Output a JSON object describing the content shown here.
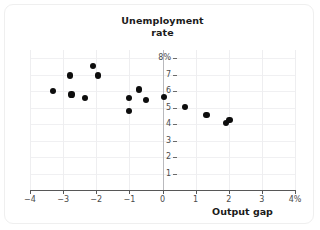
{
  "chart_data": {
    "type": "scatter",
    "title": "Unemployment rate",
    "title_line1": "Unemployment",
    "title_line2": "rate",
    "xlabel": "Output gap",
    "ylabel": "Unemployment rate",
    "xlim": [
      -4,
      4
    ],
    "ylim": [
      0,
      8.5
    ],
    "grid": true,
    "legend": null,
    "xticks": [
      -4,
      -3,
      -2,
      -1,
      0,
      1,
      2,
      3,
      4
    ],
    "xtick_labels": [
      "−4",
      "−3",
      "−2",
      "−1",
      "0",
      "1",
      "2",
      "3",
      "4%"
    ],
    "yticks": [
      1,
      2,
      3,
      4,
      5,
      6,
      7,
      8
    ],
    "ytick_labels": [
      "1",
      "2",
      "3",
      "4",
      "5",
      "6",
      "7",
      "8%"
    ],
    "point_color": "#0d0d0d",
    "points": [
      {
        "x": -3.3,
        "y": 6.0
      },
      {
        "x": -2.8,
        "y": 6.95
      },
      {
        "x": -2.75,
        "y": 5.8
      },
      {
        "x": -2.35,
        "y": 5.6
      },
      {
        "x": -2.1,
        "y": 7.55
      },
      {
        "x": -1.95,
        "y": 6.95
      },
      {
        "x": -1.0,
        "y": 5.6
      },
      {
        "x": -1.0,
        "y": 4.8
      },
      {
        "x": -0.7,
        "y": 6.1
      },
      {
        "x": -0.5,
        "y": 5.45
      },
      {
        "x": 0.05,
        "y": 5.65
      },
      {
        "x": 0.68,
        "y": 5.05
      },
      {
        "x": 1.33,
        "y": 4.55
      },
      {
        "x": 1.92,
        "y": 4.05
      },
      {
        "x": 2.02,
        "y": 4.25
      }
    ]
  }
}
